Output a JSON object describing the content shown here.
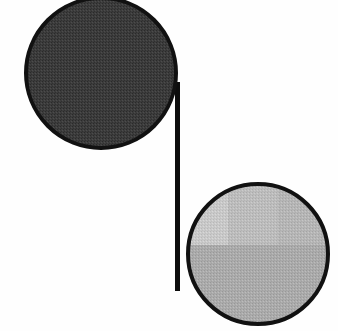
{
  "figure": {
    "canvas": {
      "width": 338,
      "height": 331,
      "background_color": "#fefefe"
    },
    "shapes": [
      {
        "id": "dark-disc",
        "name": "dark-circle",
        "role": "upper-left disc",
        "center_x": 101,
        "center_y": 73,
        "radius_x": 77,
        "radius_y": 77,
        "fill_color": "#3c3c3c",
        "texture": "halftone-dither",
        "outline_color": "#111111",
        "outline_width": 4,
        "tone_label": "dark gray"
      },
      {
        "id": "light-disc",
        "name": "light-circle",
        "role": "lower-right disc",
        "center_x": 258,
        "center_y": 254,
        "radius_x": 72,
        "radius_y": 72,
        "fill_color": "#b2b2b2",
        "texture": "halftone-dither",
        "outline_color": "#111111",
        "outline_width": 4,
        "tone_label": "light gray",
        "tone_patches": [
          {
            "id": "patch-upper-left",
            "name": "lighter-quadrant",
            "x": 186,
            "y": 182,
            "width": 42,
            "height": 63,
            "fill_color": "#c9c9c9"
          },
          {
            "id": "patch-upper-mid",
            "name": "mid-tone-band",
            "x": 228,
            "y": 182,
            "width": 50,
            "height": 63,
            "fill_color": "#bdbdbd"
          },
          {
            "id": "patch-upper-right",
            "name": "right-band",
            "x": 278,
            "y": 182,
            "width": 52,
            "height": 63,
            "fill_color": "#b6b6b6"
          },
          {
            "id": "patch-lower",
            "name": "lower-body",
            "x": 186,
            "y": 245,
            "width": 144,
            "height": 81,
            "fill_color": "#ababab"
          }
        ]
      }
    ],
    "connector": {
      "id": "vertical-bar",
      "name": "connector-line",
      "x": 175,
      "y_top": 82,
      "y_bottom": 291,
      "width": 5,
      "color": "#0d0d0d",
      "orientation": "vertical"
    }
  }
}
